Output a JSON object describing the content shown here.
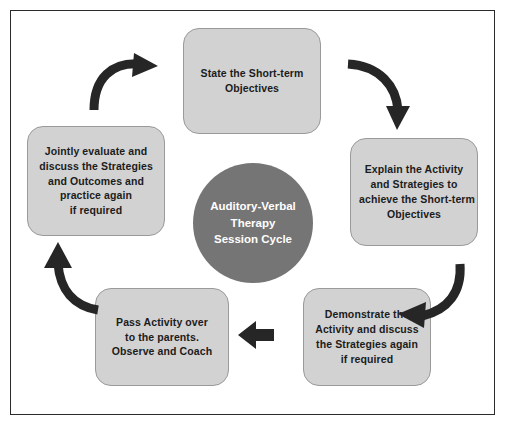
{
  "diagram": {
    "title": "Auditory-Verbal Therapy Session Cycle",
    "center": {
      "label_lines": [
        "Auditory-Verbal",
        "Therapy",
        "Session Cycle"
      ],
      "fill_color": "#757575",
      "text_color": "#ffffff"
    },
    "node_fill_color": "#d2d2d2",
    "node_border_color": "#9a9a9a",
    "node_text_color": "#1c1c1c",
    "frame_border_color": "#2b2b2b",
    "background_color": "#ffffff",
    "arrow_color": "#262626",
    "nodes": [
      {
        "id": "state",
        "position": "top",
        "lines": [
          "State the Short-term",
          "Objectives"
        ]
      },
      {
        "id": "explain",
        "position": "right",
        "lines": [
          "Explain the Activity",
          "and Strategies to",
          "achieve the Short-term",
          "Objectives"
        ]
      },
      {
        "id": "demonstrate",
        "position": "bottom-right",
        "lines": [
          "Demonstrate the",
          "Activity and discuss",
          "the Strategies again",
          "if required"
        ]
      },
      {
        "id": "pass",
        "position": "bottom-left",
        "lines": [
          "Pass Activity over",
          "to the parents.",
          "Observe and Coach"
        ]
      },
      {
        "id": "jointly",
        "position": "left",
        "lines": [
          "Jointly evaluate and",
          "discuss the Strategies",
          "and Outcomes and",
          "practice again",
          "if required"
        ]
      }
    ],
    "arrows": [
      {
        "id": "jointly-to-state",
        "icon": "curved-arrow-up-right-icon"
      },
      {
        "id": "state-to-explain",
        "icon": "curved-arrow-down-right-icon"
      },
      {
        "id": "explain-to-demonstrate",
        "icon": "curved-arrow-down-left-icon"
      },
      {
        "id": "demonstrate-to-pass",
        "icon": "arrow-left-icon"
      },
      {
        "id": "pass-to-jointly",
        "icon": "curved-arrow-up-left-icon"
      }
    ]
  }
}
